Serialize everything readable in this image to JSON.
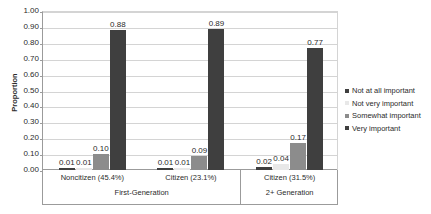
{
  "chart_data": {
    "type": "bar",
    "title": "",
    "xlabel": "",
    "ylabel": "Proportion",
    "ylim": [
      0,
      1.0
    ],
    "ytick_step": 0.1,
    "grid": true,
    "legend_position": "right",
    "categories": [
      "Noncitizen (45.4%)",
      "Citizen (23.1%)",
      "Citizen (31.5%)"
    ],
    "group_headers": [
      "First-Generation",
      "2+ Generation"
    ],
    "series": [
      {
        "name": "Not at all important",
        "color": "#3f3f3f",
        "values": [
          0.01,
          0.01,
          0.02
        ]
      },
      {
        "name": "Not very important",
        "color": "#e8e8e8",
        "values": [
          0.01,
          0.01,
          0.04
        ]
      },
      {
        "name": "Somewhat important",
        "color": "#8c8c8c",
        "values": [
          0.1,
          0.09,
          0.17
        ]
      },
      {
        "name": "Very important",
        "color": "#3f3f3f",
        "values": [
          0.88,
          0.89,
          0.77
        ]
      }
    ],
    "value_labels": [
      [
        "0.01",
        "0.01",
        "0.10",
        "0.88"
      ],
      [
        "0.01",
        "0.01",
        "0.09",
        "0.89"
      ],
      [
        "0.02",
        "0.04",
        "0.17",
        "0.77"
      ]
    ],
    "ytick_labels": [
      "1.00",
      "0.90",
      "0.80",
      "0.70",
      "0.60",
      "0.50",
      "0.40",
      "0.30",
      "0.20",
      "0.10",
      "0.00"
    ]
  }
}
